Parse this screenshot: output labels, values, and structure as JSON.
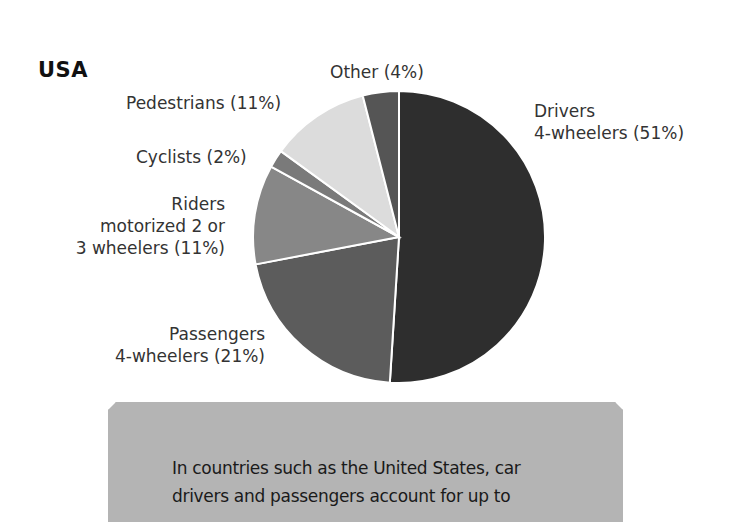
{
  "chart_data": {
    "type": "pie",
    "title": "USA",
    "start_angle": "12 o'clock, Drivers clockwise",
    "slices": [
      {
        "label": "Drivers 4-wheelers",
        "value": 51,
        "color": "#2e2e2e"
      },
      {
        "label": "Passengers 4-wheelers",
        "value": 21,
        "color": "#5c5c5c"
      },
      {
        "label": "Riders motorized 2 or 3 wheelers",
        "value": 11,
        "color": "#878787"
      },
      {
        "label": "Cyclists",
        "value": 2,
        "color": "#7a7a7a"
      },
      {
        "label": "Pedestrians",
        "value": 11,
        "color": "#dcdcdc"
      },
      {
        "label": "Other",
        "value": 4,
        "color": "#555555"
      }
    ],
    "legend": "none (direct labels)"
  },
  "title": "USA",
  "labels": {
    "other": "Other (4%)",
    "pedestrians": "Pedestrians (11%)",
    "cyclists": "Cyclists (2%)",
    "riders_line1": "Riders",
    "riders_line2": "motorized 2 or",
    "riders_line3": "3 wheelers (11%)",
    "passengers_line1": "Passengers",
    "passengers_line2": "4-wheelers (21%)",
    "drivers_line1": "Drivers",
    "drivers_line2": "4-wheelers (51%)"
  },
  "note": {
    "line1": "In countries such as the United States, car",
    "line2": "drivers and passengers account for up to"
  }
}
